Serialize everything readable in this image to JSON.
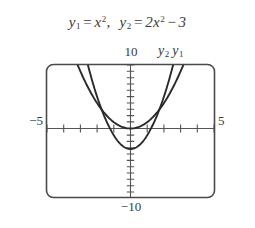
{
  "figure": {
    "caption_equations": [
      {
        "lhs": "y",
        "lhs_sub": "1",
        "eq": "=",
        "rhs_plain": "x",
        "rhs_sup": "2",
        "trailing": ","
      },
      {
        "lhs": "y",
        "lhs_sub": "2",
        "eq": "=",
        "rhs_coeff": "2",
        "rhs_plain": "x",
        "rhs_sup": "2",
        "tail_op": "−",
        "tail_const": "3"
      }
    ],
    "equation_text": "y₁ = x²,  y₂ = 2x² − 3",
    "axis_labels": {
      "y_max": "10",
      "y_min": "−10",
      "x_min": "−5",
      "x_max": "5"
    },
    "curve_labels": [
      {
        "name": "y",
        "sub": "2"
      },
      {
        "name": "y",
        "sub": "1"
      }
    ],
    "colors": {
      "background": "#ffffff",
      "frame": "#4a4a4a",
      "axis": "#555555",
      "curve": "#2b2b2b",
      "text": "#3a3a3a"
    }
  },
  "chart_data": {
    "type": "line",
    "xlabel": "",
    "ylabel": "",
    "xlim": [
      -5,
      5
    ],
    "ylim": [
      -10,
      10
    ],
    "grid": false,
    "legend_position": "above-right",
    "xticks": [
      -5,
      -4,
      -3,
      -2,
      -1,
      0,
      1,
      2,
      3,
      4,
      5
    ],
    "yticks": [
      -10,
      -9,
      -8,
      -7,
      -6,
      -5,
      -4,
      -3,
      -2,
      -1,
      0,
      1,
      2,
      3,
      4,
      5,
      6,
      7,
      8,
      9,
      10
    ],
    "xtick_labels": [
      "−5",
      "",
      "",
      "",
      "",
      "",
      "",
      "",
      "",
      "",
      "5"
    ],
    "ytick_labels": [
      "−10",
      "",
      "",
      "",
      "",
      "",
      "",
      "",
      "",
      "",
      "",
      "",
      "",
      "",
      "",
      "",
      "",
      "",
      "",
      "",
      "10"
    ],
    "series": [
      {
        "name": "y₁",
        "equation": "y = x^2",
        "coefficients": {
          "a": 1,
          "b": 0,
          "c": 0
        },
        "vertex": [
          0,
          0
        ],
        "x": [
          -3.16,
          -3.0,
          -2.5,
          -2.0,
          -1.5,
          -1.0,
          -0.5,
          0.0,
          0.5,
          1.0,
          1.5,
          2.0,
          2.5,
          3.0,
          3.16
        ],
        "values": [
          10.0,
          9.0,
          6.25,
          4.0,
          2.25,
          1.0,
          0.25,
          0.0,
          0.25,
          1.0,
          2.25,
          4.0,
          6.25,
          9.0,
          10.0
        ]
      },
      {
        "name": "y₂",
        "equation": "y = 2x^2 - 3",
        "coefficients": {
          "a": 2,
          "b": 0,
          "c": -3
        },
        "vertex": [
          0,
          -3
        ],
        "x": [
          -2.55,
          -2.5,
          -2.0,
          -1.5,
          -1.0,
          -0.5,
          0.0,
          0.5,
          1.0,
          1.5,
          2.0,
          2.5,
          2.55
        ],
        "values": [
          10.0,
          9.5,
          5.0,
          1.5,
          -1.0,
          -2.5,
          -3.0,
          -2.5,
          -1.0,
          1.5,
          5.0,
          9.5,
          10.0
        ]
      }
    ],
    "intersections": [
      [
        -1.732,
        3.0
      ],
      [
        1.732,
        3.0
      ]
    ]
  }
}
